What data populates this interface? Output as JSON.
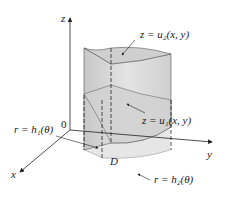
{
  "diagram": {
    "axes": {
      "z": "z",
      "y": "y",
      "x": "x",
      "origin": "0"
    },
    "labels": {
      "upper_surface": "z = u₂(x, y)",
      "lower_surface": "z = u₁(x, y)",
      "inner_boundary": "r = h₁(θ)",
      "outer_boundary": "r = h₂(θ)",
      "region": "D"
    },
    "colors": {
      "surface_fill": "#d9d9d9",
      "top_fill": "#cfcfcf",
      "region_fill": "#e6e6e6",
      "line": "#222222"
    }
  }
}
